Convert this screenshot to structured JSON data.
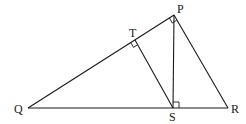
{
  "diagram": {
    "type": "geometry-triangle",
    "points": {
      "P": {
        "label": "P",
        "x": 174,
        "y": 15
      },
      "Q": {
        "label": "Q",
        "x": 28,
        "y": 108
      },
      "R": {
        "label": "R",
        "x": 228,
        "y": 108
      },
      "S": {
        "label": "S",
        "x": 173,
        "y": 108
      },
      "T": {
        "label": "T",
        "x": 135,
        "y": 40
      }
    },
    "segments": [
      "PQ",
      "QR",
      "PR",
      "PS",
      "ST"
    ],
    "right_angles": [
      "QPR",
      "PTS",
      "PSR"
    ],
    "colors": {
      "line": "#1a1a1a",
      "background": "#ffffff"
    }
  }
}
